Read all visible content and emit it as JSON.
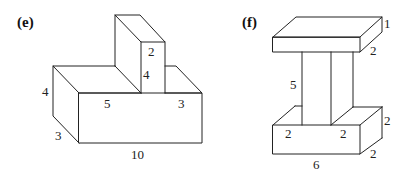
{
  "figures": [
    {
      "id": "e",
      "label": "(e)",
      "shape": "L-shaped block with raised tower",
      "dimensions": {
        "tower_depth": "2",
        "tower_height": "4",
        "left_step_width": "5",
        "right_step_width": "3",
        "base_height": "4",
        "base_depth": "3",
        "base_length": "10"
      }
    },
    {
      "id": "f",
      "label": "(f)",
      "shape": "I-beam",
      "dimensions": {
        "top_flange_thickness": "1",
        "top_flange_depth": "2",
        "web_height": "5",
        "bottom_left_flange_width": "2",
        "bottom_right_flange_width": "2",
        "bottom_flange_height": "2",
        "bottom_flange_depth": "2",
        "base_length": "6"
      }
    }
  ]
}
